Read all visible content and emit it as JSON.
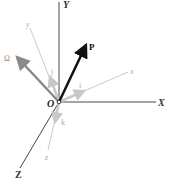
{
  "diagram": {
    "title": "",
    "origin_label": "O",
    "fixed_axes": [
      {
        "name": "X",
        "label": "X"
      },
      {
        "name": "Y",
        "label": "Y"
      },
      {
        "name": "Z",
        "label": "Z"
      }
    ],
    "rotating_axes": [
      {
        "name": "x",
        "label": "x"
      },
      {
        "name": "y",
        "label": "y"
      },
      {
        "name": "z",
        "label": "z"
      }
    ],
    "unit_vectors": [
      {
        "name": "i",
        "label": "i"
      },
      {
        "name": "j",
        "label": "j"
      },
      {
        "name": "k",
        "label": "k"
      }
    ],
    "vectors": [
      {
        "name": "P",
        "label": "P"
      },
      {
        "name": "Omega",
        "label": "Ω"
      }
    ],
    "colors": {
      "fixed_axis": "#333333",
      "rotating_axis": "#b8b8b8",
      "unit_vector": "#c8c8c8",
      "vector_P": "#111111",
      "vector_Omega": "#8a8a8a"
    }
  }
}
